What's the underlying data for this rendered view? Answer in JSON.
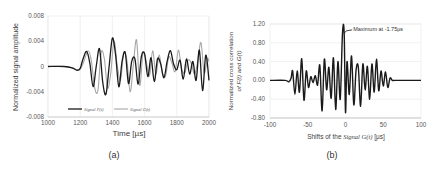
{
  "chart_data": [
    {
      "type": "line",
      "panel": "a",
      "caption": "(a)",
      "title": "",
      "xlabel": "Time [µs]",
      "ylabel": "Normalized signal amplitude",
      "xlim": [
        1000,
        2000
      ],
      "ylim": [
        -0.008,
        0.008
      ],
      "xticks": [
        "1000",
        "1200",
        "1400",
        "1600",
        "1800",
        "2000"
      ],
      "yticks": [
        "0.008",
        "0.004",
        "0",
        "-0.004",
        "-0.008"
      ],
      "grid": "vertical",
      "legend": [
        "Signal F(t)",
        "Signal G(t)"
      ],
      "legend_position": "bottom inside",
      "series": [
        {
          "name": "Signal F(t)",
          "color": "#1a1a1a",
          "x": [
            1000,
            1100,
            1150,
            1180,
            1200,
            1215,
            1240,
            1260,
            1280,
            1300,
            1320,
            1340,
            1360,
            1380,
            1400,
            1420,
            1440,
            1460,
            1480,
            1500,
            1520,
            1540,
            1560,
            1580,
            1600,
            1620,
            1640,
            1660,
            1680,
            1700,
            1720,
            1740,
            1760,
            1780,
            1800,
            1820,
            1840,
            1860,
            1880,
            1900,
            1920,
            1940,
            1960,
            1980,
            2000
          ],
          "values": [
            0,
            0,
            -0.0002,
            -0.0006,
            -0.0003,
            0.001,
            0.0024,
            0.0005,
            -0.0032,
            0.0001,
            0.0028,
            -0.0025,
            -0.0044,
            0.0001,
            0.0045,
            0.0018,
            -0.0032,
            0.0008,
            0.0022,
            -0.0027,
            0.0008,
            0.0012,
            -0.0028,
            0.0016,
            0.002,
            -0.0016,
            0.0014,
            -0.0024,
            0.0012,
            0.0004,
            -0.0018,
            0.0008,
            0.0025,
            0.0004,
            -0.0005,
            0.001,
            -0.002,
            0.0012,
            -0.0012,
            0.0008,
            -0.0022,
            0.0026,
            -0.0038,
            0.0018,
            -0.0022
          ]
        },
        {
          "name": "Signal G(t)",
          "color": "#a6a6a6",
          "x": [
            1000,
            1100,
            1150,
            1180,
            1200,
            1220,
            1250,
            1270,
            1290,
            1310,
            1330,
            1350,
            1370,
            1390,
            1410,
            1430,
            1450,
            1470,
            1490,
            1510,
            1530,
            1550,
            1570,
            1590,
            1610,
            1630,
            1650,
            1670,
            1690,
            1710,
            1730,
            1750,
            1770,
            1790,
            1810,
            1830,
            1850,
            1870,
            1890,
            1910,
            1930,
            1950,
            1970,
            1990,
            2000
          ],
          "values": [
            0,
            0,
            -0.0002,
            -0.0005,
            -0.0004,
            0.0006,
            0.0025,
            0.0008,
            -0.0034,
            -0.0038,
            0.0022,
            0.0012,
            -0.0034,
            -0.001,
            0.004,
            0.0002,
            -0.0022,
            0.002,
            0.001,
            -0.004,
            0.0002,
            0.0042,
            -0.003,
            0.0022,
            0.0008,
            -0.0015,
            0.0025,
            -0.0012,
            0.0018,
            -0.001,
            -0.0015,
            0.0015,
            0.0005,
            -0.0008,
            0.0026,
            -0.0004,
            -0.001,
            0.001,
            0.0005,
            -0.0012,
            0.0008,
            0.0038,
            -0.001,
            0.0012,
            0.0008
          ]
        }
      ]
    },
    {
      "type": "line",
      "panel": "b",
      "caption": "(b)",
      "title": "",
      "xlabel": "Shifts of the Signal G(t) [µs]",
      "ylabel": "Normalized cross correlation of F(t) and G(t)",
      "xlim": [
        -100,
        100
      ],
      "ylim": [
        -0.8,
        1.2
      ],
      "xticks": [
        "-100",
        "-50",
        "0",
        "50",
        "100"
      ],
      "yticks": [
        "1.20",
        "0.80",
        "0.40",
        "0.00",
        "-0.40",
        "-0.80"
      ],
      "grid": "both",
      "annotation": {
        "text": "Maximum at -1.75µs",
        "x": -1.75,
        "y": 1.0
      },
      "series": [
        {
          "name": "Cross correlation",
          "color": "#1a1a1a",
          "x": [
            -100,
            -80,
            -75,
            -72,
            -70,
            -67,
            -64,
            -61,
            -58,
            -55,
            -52,
            -49,
            -46,
            -43,
            -40,
            -37,
            -34,
            -31,
            -28,
            -25,
            -22,
            -19,
            -16,
            -13,
            -10,
            -7,
            -4,
            -1.75,
            0,
            2,
            5,
            8,
            11,
            14,
            17,
            20,
            23,
            26,
            29,
            32,
            35,
            38,
            41,
            44,
            47,
            50,
            53,
            56,
            59,
            62,
            65,
            68,
            71,
            74,
            78,
            100
          ],
          "values": [
            0,
            0,
            -0.03,
            0.05,
            0.2,
            -0.3,
            0.2,
            -0.25,
            0.46,
            -0.42,
            0.2,
            -0.15,
            0.08,
            -0.05,
            0.1,
            -0.1,
            0.32,
            -0.65,
            0.45,
            -0.2,
            0.28,
            -0.38,
            0.48,
            -0.62,
            0.4,
            -0.4,
            1.0,
            1.0,
            -0.68,
            0.4,
            -0.3,
            0.52,
            -0.52,
            0.22,
            0.28,
            -0.55,
            0.35,
            -0.2,
            0.3,
            -0.4,
            0.35,
            -0.25,
            0.45,
            -0.22,
            0.2,
            -0.12,
            0.18,
            -0.15,
            0.05,
            0.0,
            0.0,
            0.0,
            0.0,
            0.0,
            0.0,
            0.0
          ]
        }
      ]
    }
  ],
  "figure": {
    "a": {
      "caption": "(a)",
      "xlabel": "Time [µs]",
      "ylabel": "Normalized signal amplitude",
      "legend_f": "Signal F(t)",
      "legend_g": "Signal G(t)"
    },
    "b": {
      "caption": "(b)",
      "xlabel_prefix": "Shifts of the ",
      "xlabel_italic": "Signal G(t)",
      "xlabel_suffix": " [µs]",
      "ylabel_line1": "Normalized cross correlation",
      "ylabel_line2": "of F(t) and G(t)",
      "annotation": "Maximum at -1.75µs"
    }
  }
}
